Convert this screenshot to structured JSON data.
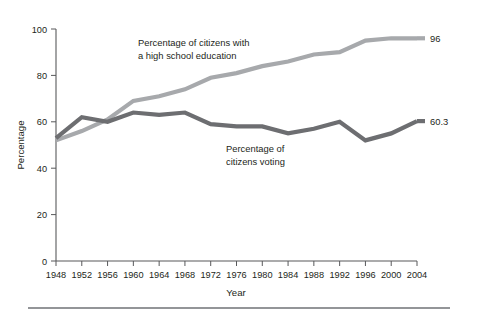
{
  "chart_data": {
    "type": "line",
    "title": "",
    "xlabel": "Year",
    "ylabel": "Percentage",
    "xlim": [
      1948,
      2004
    ],
    "ylim": [
      0,
      100
    ],
    "grid": false,
    "legend_position": "inline-annotations",
    "x": [
      1948,
      1952,
      1956,
      1960,
      1964,
      1968,
      1972,
      1976,
      1980,
      1984,
      1988,
      1992,
      1996,
      2000,
      2004
    ],
    "xtick_labels": [
      "1948",
      "1952",
      "1956",
      "1960",
      "1964",
      "1968",
      "1972",
      "1976",
      "1980",
      "1984",
      "1988",
      "1992",
      "1996",
      "2000",
      "2004"
    ],
    "ytick_labels": [
      "0",
      "20",
      "40",
      "60",
      "80",
      "100"
    ],
    "yticks": [
      0,
      20,
      40,
      60,
      80,
      100
    ],
    "series": [
      {
        "name": "Percentage of citizens with a high school education",
        "color": "#a7a9ac",
        "width": 4.2,
        "values": [
          52,
          56,
          61,
          69,
          71,
          74,
          79,
          81,
          84,
          86,
          89,
          90,
          95,
          96,
          96
        ],
        "end_label": "96"
      },
      {
        "name": "Percentage of citizens voting",
        "color": "#6d6e71",
        "width": 4.2,
        "values": [
          53,
          62,
          60,
          64,
          63,
          64,
          59,
          58,
          58,
          55,
          57,
          60,
          52,
          55,
          60.3
        ],
        "end_label": "60.3"
      }
    ],
    "annotations": [
      {
        "name": "education-annotation",
        "lines": [
          "Percentage of citizens with",
          "a high school education"
        ],
        "x": 138,
        "y": 46
      },
      {
        "name": "voting-annotation",
        "lines": [
          "Percentage of",
          "citizens voting"
        ],
        "x": 226,
        "y": 152
      }
    ]
  },
  "figure": {
    "background": "#ffffff",
    "axis_color": "#58595b",
    "text_color": "#231f20",
    "rule_color": "#939598"
  }
}
